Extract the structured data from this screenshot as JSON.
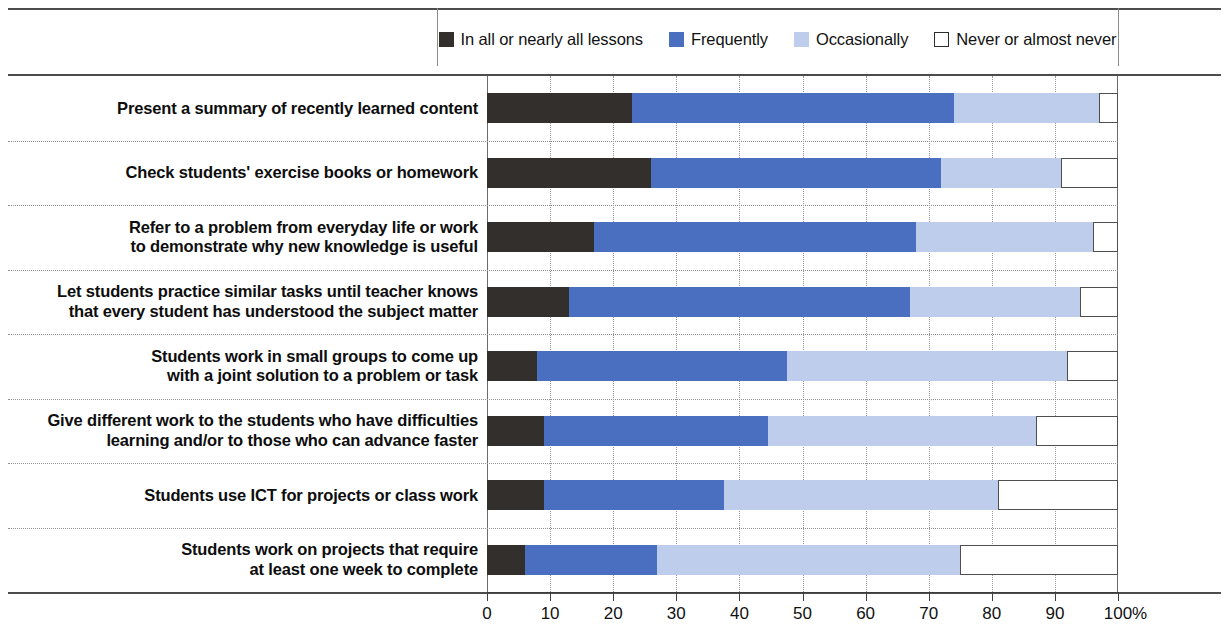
{
  "legend": {
    "items": [
      {
        "label": "In all or nearly all lessons",
        "color": "#332f2d",
        "swatch": "filled"
      },
      {
        "label": "Frequently",
        "color": "#4a6fc0",
        "swatch": "filled"
      },
      {
        "label": "Occasionally",
        "color": "#bdcdeb",
        "swatch": "filled"
      },
      {
        "label": "Never or almost never",
        "color": "#ffffff",
        "swatch": "outlined"
      }
    ]
  },
  "axis": {
    "unit": "%",
    "ticks": [
      "0",
      "10",
      "20",
      "30",
      "40",
      "50",
      "60",
      "70",
      "80",
      "90",
      "100"
    ]
  },
  "chart_data": {
    "type": "bar",
    "subtype": "stacked-horizontal-100",
    "title": "",
    "xlabel": "%",
    "ylabel": "",
    "xlim": [
      0,
      100
    ],
    "grid": true,
    "legend_position": "top",
    "categories": [
      "Present a summary of recently learned content",
      "Check students' exercise books or homework",
      "Refer to a problem from everyday life or work to demonstrate why new knowledge is useful",
      "Let students practice similar tasks until teacher knows that every student has understood the subject matter",
      "Students work in small groups to come up with a joint solution to a problem or task",
      "Give different work to the students who have difficulties learning and/or to those who can advance faster",
      "Students use ICT for projects or class work",
      "Students work on projects that require at least one week to complete"
    ],
    "series": [
      {
        "name": "In all or nearly all lessons",
        "color": "#332f2d",
        "values": [
          23,
          26,
          17,
          13,
          8,
          9,
          9,
          6
        ]
      },
      {
        "name": "Frequently",
        "color": "#4a6fc0",
        "values": [
          51,
          46,
          51,
          54,
          39.5,
          35.5,
          28.5,
          21
        ]
      },
      {
        "name": "Occasionally",
        "color": "#bdcdeb",
        "values": [
          23,
          19,
          28,
          27,
          44.5,
          42.5,
          43.5,
          48
        ]
      },
      {
        "name": "Never or almost never",
        "color": "#ffffff",
        "values": [
          3,
          9,
          4,
          6,
          8,
          13,
          19,
          25
        ]
      }
    ]
  },
  "rows": [
    {
      "label_lines": [
        "Present a summary of recently learned content"
      ],
      "segments": [
        23,
        51,
        23,
        3
      ]
    },
    {
      "label_lines": [
        "Check students' exercise books or homework"
      ],
      "segments": [
        26,
        46,
        19,
        9
      ]
    },
    {
      "label_lines": [
        "Refer to a problem from everyday life or work",
        "to demonstrate why new knowledge is useful"
      ],
      "segments": [
        17,
        51,
        28,
        4
      ]
    },
    {
      "label_lines": [
        "Let students practice similar tasks until teacher knows",
        "that every student has understood the subject matter"
      ],
      "segments": [
        13,
        54,
        27,
        6
      ]
    },
    {
      "label_lines": [
        "Students work in small groups to come up",
        "with a joint solution to a problem or task"
      ],
      "segments": [
        8,
        39.5,
        44.5,
        8
      ]
    },
    {
      "label_lines": [
        "Give different work to the students who have difficulties",
        "learning and/or to those who can advance faster"
      ],
      "segments": [
        9,
        35.5,
        42.5,
        13
      ]
    },
    {
      "label_lines": [
        "Students use ICT for projects or class work"
      ],
      "segments": [
        9,
        28.5,
        43.5,
        19
      ]
    },
    {
      "label_lines": [
        "Students work on projects that require",
        "at least one week to complete"
      ],
      "segments": [
        6,
        21,
        48,
        25
      ]
    }
  ]
}
